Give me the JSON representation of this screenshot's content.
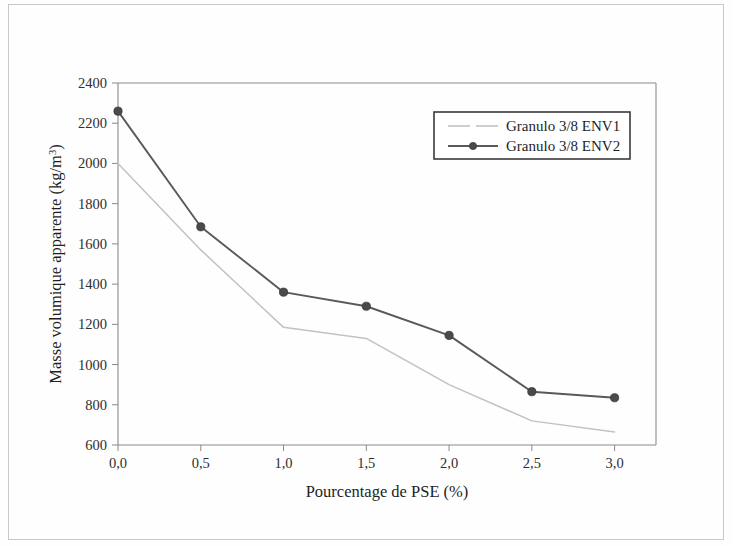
{
  "chart_data": {
    "type": "line",
    "title": "",
    "xlabel": "Pourcentage de PSE (%)",
    "ylabel": "Masse volumique apparente (kg/m",
    "ylabel_sup": "3",
    "ylabel_tail": ")",
    "x": [
      0.0,
      0.5,
      1.0,
      1.5,
      2.0,
      2.5,
      3.0
    ],
    "xtick_labels": [
      "0,0",
      "0,5",
      "1,0",
      "1,5",
      "2,0",
      "2,5",
      "3,0"
    ],
    "ytick_labels": [
      "600",
      "800",
      "1000",
      "1200",
      "1400",
      "1600",
      "1800",
      "2000",
      "2200",
      "2400"
    ],
    "ytick_values": [
      600,
      800,
      1000,
      1200,
      1400,
      1600,
      1800,
      2000,
      2200,
      2400
    ],
    "xlim": [
      0.0,
      3.25
    ],
    "ylim": [
      600,
      2400
    ],
    "grid": false,
    "legend_position": "upper right",
    "series": [
      {
        "name": "Granulo 3/8 ENV1",
        "color": "#c2c2c2",
        "marker": "none",
        "values": [
          2000,
          1570,
          1185,
          1130,
          900,
          720,
          665
        ]
      },
      {
        "name": "Granulo 3/8 ENV2",
        "color": "#595959",
        "marker": "circle",
        "values": [
          2260,
          1685,
          1360,
          1290,
          1145,
          865,
          835
        ]
      }
    ]
  },
  "legend": {
    "items": [
      {
        "label": "Granulo 3/8 ENV1"
      },
      {
        "label": "Granulo 3/8 ENV2"
      }
    ]
  },
  "colors": {
    "env1": "#c2c2c2",
    "env2": "#595959",
    "axis": "#8a8a8a",
    "text": "#1f1f1f",
    "page_border": "#c9c9c9"
  }
}
